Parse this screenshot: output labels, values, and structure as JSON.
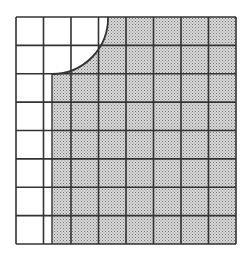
{
  "figure": {
    "grid": {
      "rows": 8,
      "cols": 8,
      "x": 16,
      "y": 17,
      "width": 220,
      "height": 227
    },
    "shaded_region": {
      "left_edge_x": 52,
      "arc_center": [
        52,
        17
      ],
      "arc_radius": 56,
      "arc_start": [
        108,
        17
      ],
      "arc_end": [
        52,
        74
      ]
    },
    "colors": {
      "line": "#333333",
      "shade_fill": "#d9d9d9",
      "shade_dot": "#777777",
      "background": "#ffffff"
    }
  }
}
